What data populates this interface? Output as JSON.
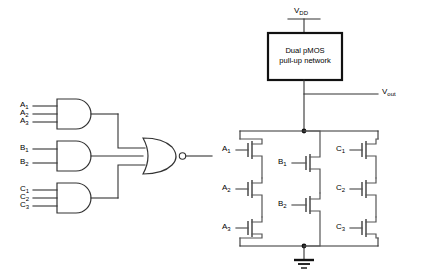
{
  "diagram": {
    "type": "circuit-schematic"
  },
  "logic_view": {
    "and_gates": [
      {
        "id": "and-a",
        "inputs": [
          "A",
          "A",
          "A"
        ],
        "subscripts": [
          "1",
          "2",
          "3"
        ]
      },
      {
        "id": "and-b",
        "inputs": [
          "B",
          "B"
        ],
        "subscripts": [
          "1",
          "2"
        ]
      },
      {
        "id": "and-c",
        "inputs": [
          "C",
          "C",
          "C"
        ],
        "subscripts": [
          "1",
          "2",
          "3"
        ]
      }
    ],
    "nor_gate": {
      "id": "nor-1",
      "label": "NOR",
      "inputs": 3,
      "inverting": true
    }
  },
  "transistor_view": {
    "supply_label": "V",
    "supply_sub": "DD",
    "output_label": "V",
    "output_sub": "out",
    "pullup_box": {
      "line1": "Dual pMOS",
      "line2": "pull-up network"
    },
    "ground_label": "GND",
    "branches": [
      {
        "name": "branch-a",
        "devices": [
          {
            "label": "A",
            "sub": "1"
          },
          {
            "label": "A",
            "sub": "2"
          },
          {
            "label": "A",
            "sub": "3"
          }
        ]
      },
      {
        "name": "branch-b",
        "devices": [
          {
            "label": "B",
            "sub": "1"
          },
          {
            "label": "B",
            "sub": "2"
          }
        ]
      },
      {
        "name": "branch-c",
        "devices": [
          {
            "label": "C",
            "sub": "1"
          },
          {
            "label": "C",
            "sub": "2"
          },
          {
            "label": "C",
            "sub": "3"
          }
        ]
      }
    ]
  },
  "colors": {
    "ink": "#333333",
    "ink_strong": "#111111",
    "device": "#555555",
    "background": "#ffffff"
  }
}
